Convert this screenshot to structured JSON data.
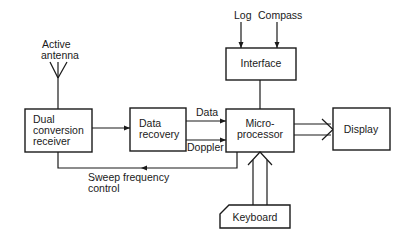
{
  "diagram": {
    "blocks": {
      "receiver": {
        "lines": [
          "Dual",
          "conversion",
          "receiver"
        ]
      },
      "data_recovery": {
        "lines": [
          "Data",
          "recovery"
        ]
      },
      "microprocessor": {
        "lines": [
          "Micro-",
          "processor"
        ]
      },
      "display": {
        "lines": [
          "Display"
        ]
      },
      "interface": {
        "lines": [
          "Interface"
        ]
      },
      "keyboard": {
        "lines": [
          "Keyboard"
        ]
      }
    },
    "labels": {
      "antenna": [
        "Active",
        "antenna"
      ],
      "log": "Log",
      "compass": "Compass",
      "data": "Data",
      "doppler": "Doppler",
      "sweep": [
        "Sweep  frequency",
        "control"
      ]
    },
    "connections": [
      {
        "from": "antenna",
        "to": "receiver"
      },
      {
        "from": "receiver",
        "to": "data_recovery"
      },
      {
        "from": "data_recovery",
        "to": "microprocessor",
        "label": "Data"
      },
      {
        "from": "data_recovery",
        "to": "microprocessor",
        "label": "Doppler"
      },
      {
        "from": "microprocessor",
        "to": "receiver",
        "label": "Sweep frequency control"
      },
      {
        "from": "log",
        "to": "interface"
      },
      {
        "from": "compass",
        "to": "interface"
      },
      {
        "from": "interface",
        "to": "microprocessor"
      },
      {
        "from": "microprocessor",
        "to": "display",
        "style": "double"
      },
      {
        "from": "keyboard",
        "to": "microprocessor",
        "style": "double"
      }
    ]
  }
}
